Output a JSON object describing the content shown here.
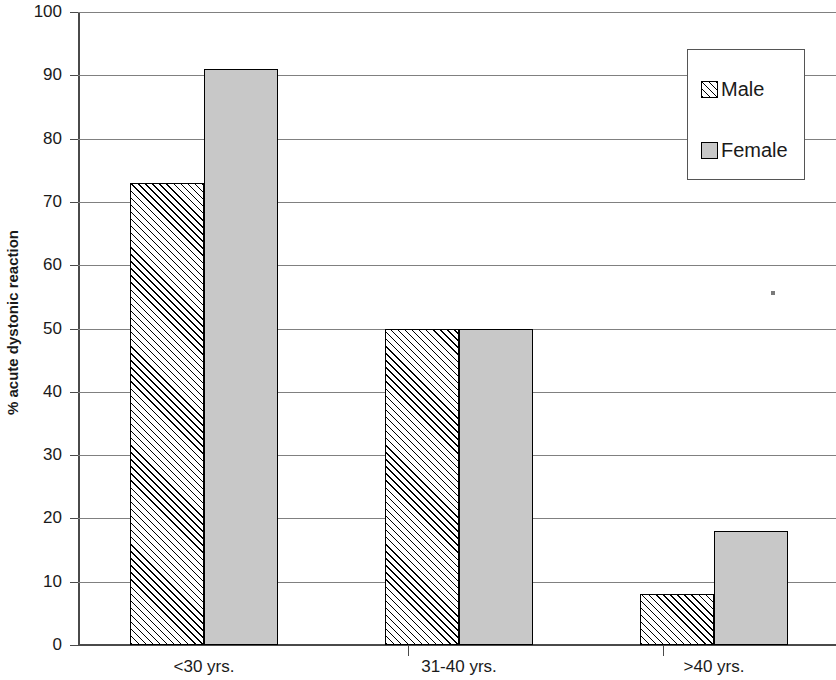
{
  "chart_data": {
    "type": "bar",
    "title": "",
    "xlabel": "",
    "ylabel": "% acute dystonic reaction",
    "categories": [
      "<30 yrs.",
      "31-40 yrs.",
      ">40 yrs."
    ],
    "series": [
      {
        "name": "Male",
        "values": [
          73,
          50,
          8
        ],
        "pattern": "diagonal-hatch",
        "color": "#ffffff"
      },
      {
        "name": "Female",
        "values": [
          91,
          50,
          18
        ],
        "pattern": "solid",
        "color": "#c8c8c8"
      }
    ],
    "ylim": [
      0,
      100
    ],
    "y_ticks": [
      0,
      10,
      20,
      30,
      40,
      50,
      60,
      70,
      80,
      90,
      100
    ],
    "y_tick_labels": [
      "0",
      "10",
      "20",
      "30",
      "40",
      "50",
      "60",
      "70",
      "80",
      "90",
      "100"
    ],
    "grid": true,
    "grid_axis": "y",
    "legend_position": "top-right",
    "legend_entries": [
      "Male",
      "Female"
    ]
  },
  "axes": {
    "y_title": "% acute dystonic reaction",
    "axis_color": "#4a4a4a",
    "grid_color": "#808080",
    "bar_border_color": "#000000"
  },
  "legend": {
    "items": [
      {
        "label": "Male"
      },
      {
        "label": "Female"
      }
    ]
  }
}
